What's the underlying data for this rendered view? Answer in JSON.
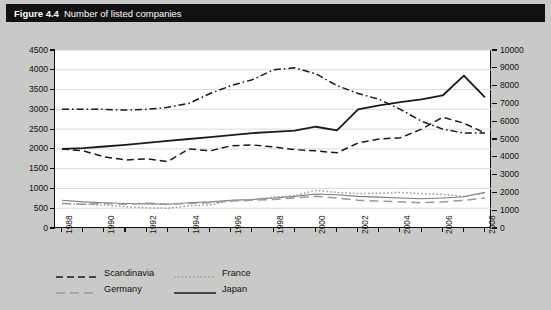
{
  "figure": {
    "number": "Figure 4.4",
    "title": "Number of listed companies"
  },
  "legend": {
    "items": [
      {
        "label": "Scandinavia",
        "style": "dashed",
        "color": "#1a1a1a",
        "width": 1.5
      },
      {
        "label": "France",
        "style": "dotted",
        "color": "#9a9a9a",
        "width": 1.4
      },
      {
        "label": "Germany",
        "style": "longdash",
        "color": "#9a9a9a",
        "width": 1.4
      },
      {
        "label": "Japan",
        "style": "solid",
        "color": "#1a1a1a",
        "width": 1.6
      }
    ]
  },
  "chart_data": {
    "type": "line",
    "title": "Number of listed companies",
    "xlabel": "",
    "ylabel": "",
    "grid": true,
    "legend_position": "bottom-left",
    "x": [
      1988,
      1989,
      1990,
      1991,
      1992,
      1993,
      1994,
      1995,
      1996,
      1997,
      1998,
      1999,
      2000,
      2001,
      2002,
      2003,
      2004,
      2005,
      2006,
      2007,
      2008
    ],
    "xtick_labels": [
      "1988",
      "1990",
      "1992",
      "1994",
      "1996",
      "1998",
      "2000",
      "2002",
      "2004",
      "2006",
      "2008"
    ],
    "xtick_years": [
      1988,
      1990,
      1992,
      1994,
      1996,
      1998,
      2000,
      2002,
      2004,
      2006,
      2008
    ],
    "left_axis": {
      "ylim": [
        0,
        4500
      ],
      "ytick_step": 500,
      "yticks": [
        0,
        500,
        1000,
        1500,
        2000,
        2500,
        3000,
        3500,
        4000,
        4500
      ]
    },
    "right_axis": {
      "ylim": [
        0,
        10000
      ],
      "ytick_step": 1000,
      "yticks": [
        0,
        1000,
        2000,
        3000,
        4000,
        5000,
        6000,
        7000,
        8000,
        9000,
        10000
      ]
    },
    "series": [
      {
        "name": "Scandinavia",
        "axis": "left",
        "style": "dashed",
        "color": "#1a1a1a",
        "values": [
          2000,
          1950,
          1800,
          1720,
          1750,
          1680,
          2000,
          1950,
          2080,
          2100,
          2050,
          1980,
          1950,
          1900,
          2150,
          2250,
          2280,
          2500,
          2800,
          2650,
          2400
        ]
      },
      {
        "name": "France",
        "axis": "left",
        "style": "dotted",
        "color": "#9a9a9a",
        "values": [
          620,
          600,
          580,
          540,
          510,
          500,
          560,
          580,
          700,
          720,
          780,
          820,
          950,
          900,
          870,
          880,
          900,
          870,
          850,
          800,
          880
        ]
      },
      {
        "name": "Germany",
        "axis": "left",
        "style": "longdash",
        "color": "#9a9a9a",
        "values": [
          620,
          600,
          620,
          600,
          630,
          600,
          620,
          640,
          680,
          700,
          720,
          760,
          800,
          760,
          700,
          680,
          660,
          640,
          660,
          700,
          760
        ]
      },
      {
        "name": "Japan",
        "axis": "left",
        "style": "solid",
        "color": "#1a1a1a",
        "values": [
          2000,
          2020,
          2060,
          2100,
          2150,
          2200,
          2250,
          2300,
          2350,
          2400,
          2430,
          2460,
          2480,
          2500,
          2620,
          2560,
          2530,
          2560,
          2580,
          2600,
          2620
        ]
      },
      {
        "name": "unlabeled-upper",
        "axis": "left",
        "style": "dashdot",
        "color": "#1a1a1a",
        "values": [
          3000,
          3000,
          3000,
          2980,
          3000,
          3050,
          3150,
          3400,
          3600,
          3750,
          4000,
          4050,
          3900,
          3600,
          3400,
          3250,
          3000,
          2700,
          2500,
          2400,
          2400
        ]
      },
      {
        "name": "unlabeled-lower",
        "axis": "left",
        "style": "solid-gray",
        "color": "#7d7d7d",
        "values": [
          700,
          660,
          640,
          620,
          610,
          600,
          640,
          660,
          700,
          720,
          760,
          800,
          860,
          840,
          800,
          780,
          760,
          740,
          760,
          790,
          900
        ]
      }
    ],
    "japan_solid_peak": {
      "year": 2007,
      "value": 3850
    },
    "japan_solid_path": [
      2000,
      2020,
      2060,
      2100,
      2150,
      2200,
      2250,
      2300,
      2350,
      2400,
      2430,
      2460,
      2560,
      2470,
      3000,
      3100,
      3180,
      3250,
      3350,
      3850,
      3300
    ]
  }
}
